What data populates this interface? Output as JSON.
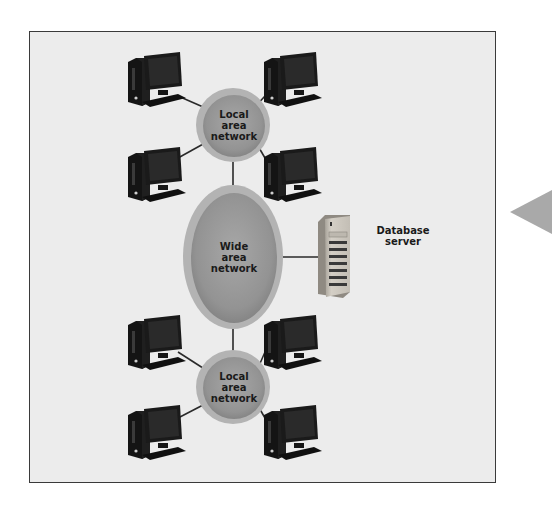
{
  "diagram": {
    "type": "network-topology",
    "colors": {
      "frame_bg": "#ececec",
      "frame_border": "#3a3a3a",
      "network_fill": "#9a9a9a",
      "network_rim": "#b5b5b5",
      "link": "#2a2a2a",
      "computer": "#151515",
      "server": "#c9c4bb",
      "side_arrow": "#a9a9a9"
    },
    "nodes": {
      "lan_top": {
        "label": "Local\narea\nnetwork"
      },
      "wan": {
        "label": "Wide\narea\nnetwork"
      },
      "lan_bottom": {
        "label": "Local\narea\nnetwork"
      },
      "database_server": {
        "label": "Database\nserver"
      }
    },
    "computers": {
      "top_lan": [
        "computer",
        "computer",
        "computer",
        "computer"
      ],
      "bottom_lan": [
        "computer",
        "computer",
        "computer",
        "computer"
      ]
    },
    "links": [
      "lan_top - computer_top_left",
      "lan_top - computer_top_right",
      "lan_top - computer_mid_left",
      "lan_top - computer_mid_right",
      "lan_top - wan",
      "wan - database_server",
      "wan - lan_bottom",
      "lan_bottom - computer_low_left",
      "lan_bottom - computer_low_right",
      "lan_bottom - computer_bottom_left",
      "lan_bottom - computer_bottom_right"
    ]
  }
}
